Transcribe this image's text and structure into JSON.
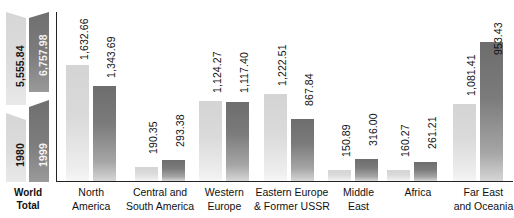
{
  "world_total": {
    "caption_line1": "World",
    "caption_line2": "Total",
    "series": [
      {
        "year": "1980",
        "value_label": "5,555.84",
        "value": 5555.84
      },
      {
        "year": "1999",
        "value_label": "6,757.98",
        "value": 6757.98
      }
    ]
  },
  "legend": {
    "year_1980": "1980",
    "year_1999": "1999"
  },
  "categories": [
    {
      "line1": "North",
      "line2": "America"
    },
    {
      "line1": "Central and",
      "line2": "South America"
    },
    {
      "line1": "Western",
      "line2": "Europe"
    },
    {
      "line1": "Eastern Europe",
      "line2": "& Former USSR"
    },
    {
      "line1": "Middle",
      "line2": "East"
    },
    {
      "line1": "Africa",
      "line2": ""
    },
    {
      "line1": "Far East",
      "line2": "and Oceania"
    }
  ],
  "bars": [
    {
      "cat": "North America",
      "v1980_label": "1,632.66",
      "v1980": 1632.66,
      "v1999_label": "1,343.69",
      "v1999": 1343.69
    },
    {
      "cat": "Central and South America",
      "v1980_label": "190.35",
      "v1980": 190.35,
      "v1999_label": "293.38",
      "v1999": 293.38
    },
    {
      "cat": "Western Europe",
      "v1980_label": "1,124.27",
      "v1980": 1124.27,
      "v1999_label": "1,117.40",
      "v1999": 1117.4
    },
    {
      "cat": "Eastern Europe & Former USSR",
      "v1980_label": "1,222.51",
      "v1980": 1222.51,
      "v1999_label": "867.84",
      "v1999": 867.84
    },
    {
      "cat": "Middle East",
      "v1980_label": "150.89",
      "v1980": 150.89,
      "v1999_label": "316.00",
      "v1999": 316.0
    },
    {
      "cat": "Africa",
      "v1980_label": "160.27",
      "v1980": 160.27,
      "v1999_label": "261.21",
      "v1999": 261.21
    },
    {
      "cat": "Far East and Oceania",
      "v1980_label": "1,081.41",
      "v1980": 1081.41,
      "v1999_label": "953.43",
      "v1999": 1953.43
    }
  ],
  "colors": {
    "bar_1980": "#d6d6d6",
    "bar_1999": "#737373",
    "axis": "#222222",
    "text": "#111111",
    "background": "#ffffff"
  },
  "chart_data": {
    "type": "bar",
    "title": "",
    "subtitle": "",
    "xlabel": "",
    "ylabel": "",
    "grid": false,
    "legend_position": "left-panel",
    "ylim": [
      0,
      2000
    ],
    "categories": [
      "North America",
      "Central and South America",
      "Western Europe",
      "Eastern Europe & Former USSR",
      "Middle East",
      "Africa",
      "Far East and Oceania"
    ],
    "series": [
      {
        "name": "1980",
        "values": [
          1632.66,
          190.35,
          1124.27,
          1222.51,
          150.89,
          160.27,
          1081.41
        ]
      },
      {
        "name": "1999",
        "values": [
          1343.69,
          293.38,
          1117.4,
          867.84,
          316.0,
          261.21,
          1953.43
        ]
      }
    ],
    "data_labels": [
      [
        "1,632.66",
        "1,343.69"
      ],
      [
        "190.35",
        "293.38"
      ],
      [
        "1,124.27",
        "1,117.40"
      ],
      [
        "1,222.51",
        "867.84"
      ],
      [
        "150.89",
        "316.00"
      ],
      [
        "160.27",
        "261.21"
      ],
      [
        "1,081.41",
        "953.43"
      ]
    ],
    "world_total": {
      "1980": 5555.84,
      "1999": 6757.98
    },
    "annotations": [
      "World Total 1980 = 5,555.84",
      "World Total 1999 = 6,757.98"
    ]
  }
}
